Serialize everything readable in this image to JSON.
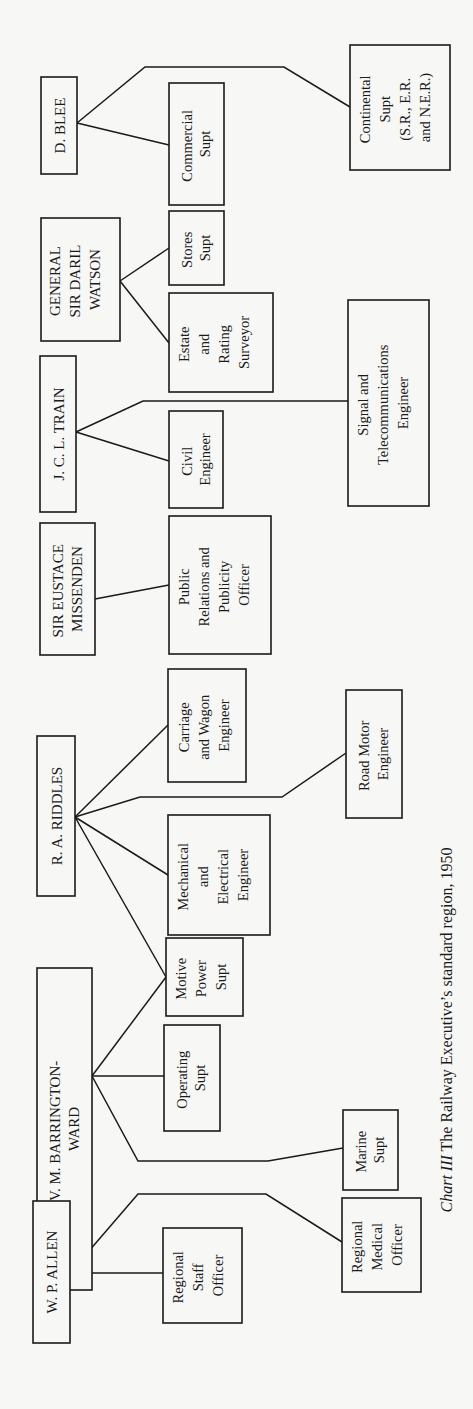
{
  "diagram": {
    "type": "org-chart",
    "orientation": "rotated-90-ccw",
    "caption": {
      "prefix": "Chart III",
      "text": " The Railway Executive’s standard region, 1950"
    },
    "members": [
      {
        "id": "allen",
        "name_lines": [
          "W. P. ALLEN"
        ],
        "reports": [
          {
            "id": "staff",
            "lines": [
              "Regional",
              "Staff",
              "Officer"
            ]
          },
          {
            "id": "medical",
            "lines": [
              "Regional",
              "Medical",
              "Officer"
            ]
          }
        ]
      },
      {
        "id": "barrington",
        "name_lines": [
          "V. M. BARRINGTON-",
          "WARD"
        ],
        "reports": [
          {
            "id": "operating",
            "lines": [
              "Operating",
              "Supt"
            ]
          },
          {
            "id": "motive",
            "lines": [
              "Motive",
              "Power",
              "Supt"
            ]
          },
          {
            "id": "marine",
            "lines": [
              "Marine",
              "Supt"
            ]
          }
        ]
      },
      {
        "id": "riddles",
        "name_lines": [
          "R. A. RIDDLES"
        ],
        "reports": [
          {
            "id": "motive",
            "lines": [
              "Motive",
              "Power",
              "Supt"
            ]
          },
          {
            "id": "mech",
            "lines": [
              "Mechanical",
              "and",
              "Electrical",
              "Engineer"
            ]
          },
          {
            "id": "carriage",
            "lines": [
              "Carriage",
              "and Wagon",
              "Engineer"
            ]
          },
          {
            "id": "road",
            "lines": [
              "Road Motor",
              "Engineer"
            ]
          }
        ]
      },
      {
        "id": "missenden",
        "name_lines": [
          "SIR EUSTACE",
          "MISSENDEN"
        ],
        "reports": [
          {
            "id": "pr",
            "lines": [
              "Public",
              "Relations and",
              "Publicity",
              "Officer"
            ]
          }
        ]
      },
      {
        "id": "train",
        "name_lines": [
          "J. C. L. TRAIN"
        ],
        "reports": [
          {
            "id": "civil",
            "lines": [
              "Civil",
              "Engineer"
            ]
          },
          {
            "id": "signal",
            "lines": [
              "Signal and",
              "Telecommunications",
              "Engineer"
            ]
          }
        ]
      },
      {
        "id": "watson",
        "name_lines": [
          "GENERAL",
          "SIR DARIL",
          "WATSON"
        ],
        "reports": [
          {
            "id": "estate",
            "lines": [
              "Estate",
              "and",
              "Rating",
              "Surveyor"
            ]
          },
          {
            "id": "stores",
            "lines": [
              "Stores",
              "Supt"
            ]
          }
        ]
      },
      {
        "id": "blee",
        "name_lines": [
          "D. BLEE"
        ],
        "reports": [
          {
            "id": "commercial",
            "lines": [
              "Commercial",
              "Supt"
            ]
          },
          {
            "id": "continental",
            "lines": [
              "Continental",
              "Supt",
              "(S.R., E.R.",
              "and N.E.R.)"
            ]
          }
        ]
      }
    ],
    "labels": {
      "allen": [
        "W. P. ALLEN"
      ],
      "barrington": [
        "V. M. BARRINGTON-",
        "WARD"
      ],
      "riddles": [
        "R. A. RIDDLES"
      ],
      "missenden": [
        "SIR EUSTACE",
        "MISSENDEN"
      ],
      "train": [
        "J. C. L. TRAIN"
      ],
      "watson": [
        "GENERAL",
        "SIR DARIL",
        "WATSON"
      ],
      "blee": [
        "D. BLEE"
      ],
      "staff": [
        "Regional",
        "Staff",
        "Officer"
      ],
      "medical": [
        "Regional",
        "Medical",
        "Officer"
      ],
      "operating": [
        "Operating",
        "Supt"
      ],
      "motive": [
        "Motive",
        "Power",
        "Supt"
      ],
      "marine": [
        "Marine",
        "Supt"
      ],
      "mech": [
        "Mechanical",
        "and",
        "Electrical",
        "Engineer"
      ],
      "carriage": [
        "Carriage",
        "and Wagon",
        "Engineer"
      ],
      "road": [
        "Road Motor",
        "Engineer"
      ],
      "pr": [
        "Public",
        "Relations and",
        "Publicity",
        "Officer"
      ],
      "civil": [
        "Civil",
        "Engineer"
      ],
      "signal": [
        "Signal and",
        "Telecommunications",
        "Engineer"
      ],
      "estate": [
        "Estate",
        "and",
        "Rating",
        "Surveyor"
      ],
      "stores": [
        "Stores",
        "Supt"
      ],
      "commercial": [
        "Commercial",
        "Supt"
      ],
      "continental": [
        "Continental",
        "Supt",
        "(S.R., E.R.",
        "and N.E.R.)"
      ]
    }
  }
}
